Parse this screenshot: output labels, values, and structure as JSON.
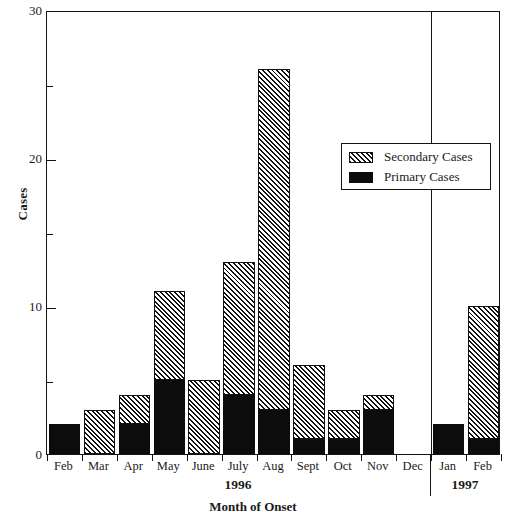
{
  "chart_data": {
    "type": "bar",
    "stacked": true,
    "title": "",
    "xlabel": "Month of Onset",
    "ylabel": "Cases",
    "ylim": [
      0,
      30
    ],
    "yticks": [
      0,
      10,
      20,
      30
    ],
    "yticks_minor": [
      5,
      15,
      25
    ],
    "grid": false,
    "legend_position": "upper right",
    "categories": [
      "Feb",
      "Mar",
      "Apr",
      "May",
      "June",
      "July",
      "Aug",
      "Sept",
      "Oct",
      "Nov",
      "Dec",
      "Jan",
      "Feb"
    ],
    "series": [
      {
        "name": "Primary Cases",
        "color": "#0c0c0c",
        "fill": "solid",
        "values": [
          2,
          0,
          2,
          5,
          0,
          4,
          3,
          1,
          1,
          3,
          0,
          2,
          1
        ]
      },
      {
        "name": "Secondary Cases",
        "color": "#8e8e8e",
        "fill": "diagonal-hatch",
        "values": [
          0,
          3,
          2,
          6,
          5,
          9,
          23,
          5,
          2,
          1,
          0,
          0,
          9
        ]
      }
    ],
    "totals": [
      2,
      3,
      4,
      11,
      5,
      13,
      26,
      6,
      3,
      4,
      0,
      2,
      10
    ],
    "year_groups": [
      {
        "label": "1996",
        "categories": [
          "Feb",
          "Mar",
          "Apr",
          "May",
          "June",
          "July",
          "Aug",
          "Sept",
          "Oct",
          "Nov",
          "Dec"
        ]
      },
      {
        "label": "1997",
        "categories": [
          "Jan",
          "Feb"
        ]
      }
    ]
  },
  "axis": {
    "y_title": "Cases",
    "x_title": "Month of Onset",
    "y_tick_labels": [
      "0",
      "10",
      "20",
      "30"
    ]
  },
  "legend": {
    "entries": [
      {
        "label": "Secondary Cases",
        "pattern": "hatch"
      },
      {
        "label": "Primary Cases",
        "pattern": "solid"
      }
    ]
  },
  "year_labels": {
    "first": "1996",
    "second": "1997"
  }
}
